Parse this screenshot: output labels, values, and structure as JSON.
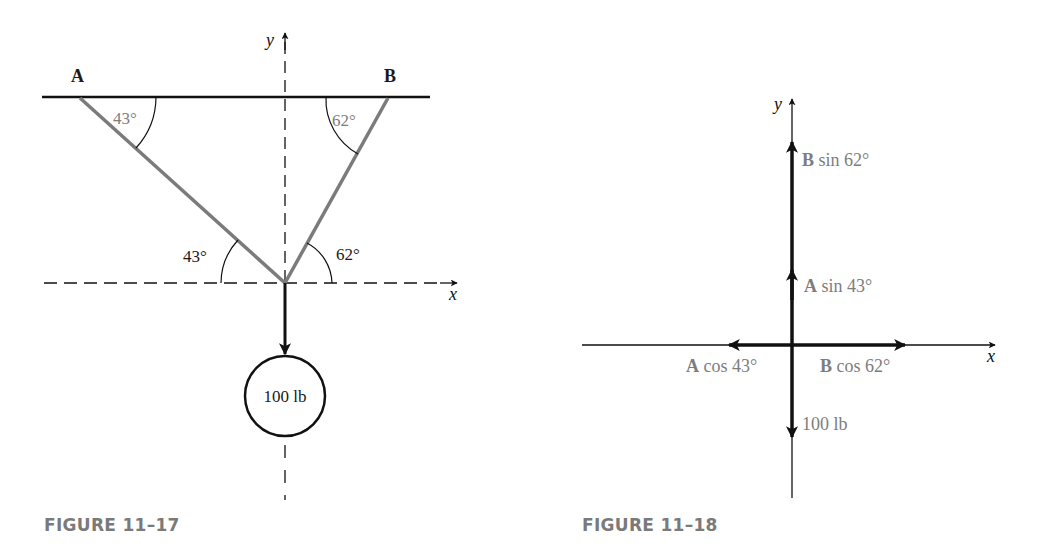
{
  "figures": [
    {
      "caption": "FIGURE 11–17",
      "axes": {
        "x_label": "x",
        "y_label": "y"
      },
      "anchors": {
        "left": "A",
        "right": "B"
      },
      "angles": {
        "top_left": "43°",
        "top_right": "62°",
        "bottom_left": "43°",
        "bottom_right": "62°"
      },
      "weight_label": "100 lb"
    },
    {
      "caption": "FIGURE 11–18",
      "axes": {
        "x_label": "x",
        "y_label": "y"
      },
      "components": {
        "b_sin": {
          "bold": "B",
          "rest": " sin 62°"
        },
        "a_sin": {
          "bold": "A",
          "rest": " sin 43°"
        },
        "a_cos": {
          "bold": "A",
          "rest": " cos 43°"
        },
        "b_cos": {
          "bold": "B",
          "rest": " cos 62°"
        },
        "weight": "100 lb"
      }
    }
  ],
  "colors": {
    "line_dark": "#111111",
    "member_gray": "#7b7b7b",
    "label_gray": "#7d7d7d",
    "caption_gray": "#7a7a7a"
  }
}
